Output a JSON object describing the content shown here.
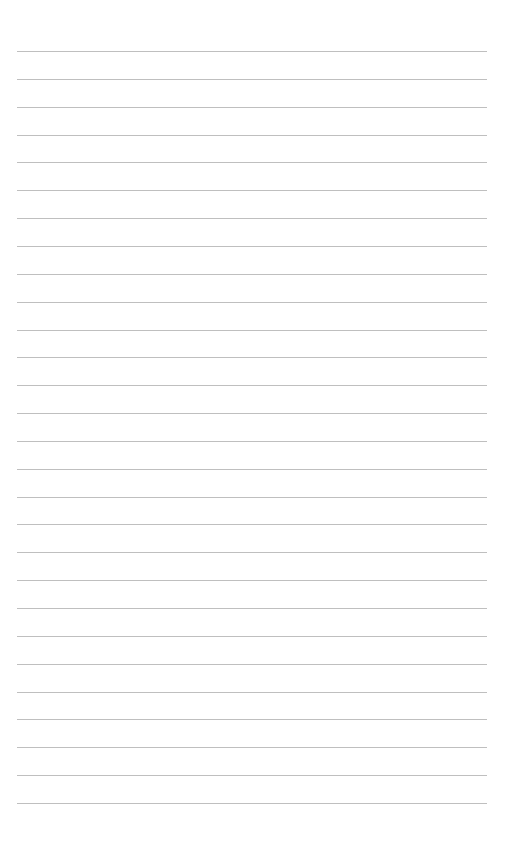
{
  "page": {
    "type": "lined-paper",
    "background_color": "#ffffff",
    "line_color": "#b4b4b4",
    "line_count": 28,
    "first_line_y": 51,
    "line_spacing": 27.85,
    "line_left": 17,
    "line_width": 470,
    "text": ""
  }
}
